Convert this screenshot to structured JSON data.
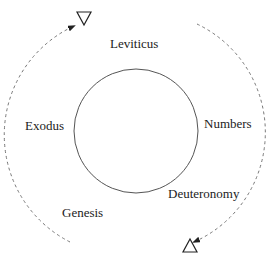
{
  "diagram": {
    "type": "cycle",
    "center_circle": true,
    "colors": {
      "stroke": "#555555",
      "dashed": "#777777",
      "text": "#222222",
      "background": "#ffffff"
    },
    "labels": {
      "leviticus": "Leviticus",
      "exodus": "Exodus",
      "numbers": "Numbers",
      "genesis": "Genesis",
      "deuteronomy": "Deuteronomy"
    },
    "markers": {
      "start": "down-triangle",
      "end": "up-triangle"
    },
    "arcs": [
      {
        "name": "left-arc",
        "style": "dashed",
        "direction": "bottom-to-top",
        "ends_at": "down-triangle"
      },
      {
        "name": "right-arc",
        "style": "dashed",
        "direction": "top-to-bottom",
        "ends_at": "up-triangle"
      }
    ]
  }
}
